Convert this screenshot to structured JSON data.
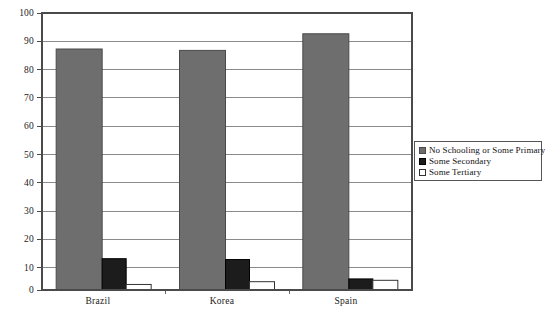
{
  "chart_data": {
    "type": "bar",
    "title": "",
    "xlabel": "",
    "ylabel": "",
    "ylim": [
      0,
      100
    ],
    "yticks": [
      0,
      10,
      20,
      30,
      40,
      50,
      60,
      70,
      80,
      90,
      100
    ],
    "ytick_labels": [
      "0",
      "10",
      "20",
      "30",
      "40",
      "50",
      "60",
      "70",
      "80",
      "90",
      "100"
    ],
    "grid": true,
    "grid_axis": "y",
    "legend_position": "right",
    "categories": [
      "Brazil",
      "Korea",
      "Spain"
    ],
    "series": [
      {
        "name": "No Schooling or Some Primary",
        "color": "#6e6e6e",
        "border": "#4a4a4a",
        "values": [
          87,
          86.5,
          92.5
        ]
      },
      {
        "name": "Some Secondary",
        "color": "#1c1c1c",
        "border": "#000000",
        "values": [
          11.3,
          11,
          4
        ]
      },
      {
        "name": "Some Tertiary",
        "color": "#ffffff",
        "border": "#333333",
        "values": [
          2,
          3,
          3.5
        ]
      }
    ]
  },
  "legend": {
    "items": [
      {
        "label": "No Schooling or Some Primary",
        "swatch": "gray"
      },
      {
        "label": "Some Secondary",
        "swatch": "black"
      },
      {
        "label": "Some Tertiary",
        "swatch": "white"
      }
    ]
  },
  "axes": {
    "y_labels": [
      "100",
      "90",
      "80",
      "70",
      "60",
      "50",
      "40",
      "30",
      "20",
      "10",
      "0"
    ],
    "x_labels": [
      "Brazil",
      "Korea",
      "Spain"
    ]
  },
  "colors": {
    "plot_border": "#4a4a4a",
    "gridline": "#8a8a8a",
    "background": "#ffffff",
    "series_primary": "#6e6e6e",
    "series_secondary": "#1c1c1c",
    "series_tertiary": "#ffffff"
  }
}
